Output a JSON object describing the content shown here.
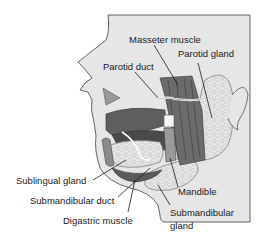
{
  "diagram": {
    "colors": {
      "skin": "#e6e6e6",
      "outline": "#555555",
      "muscle": "#6b6b6b",
      "muscle_dark": "#4a4a4a",
      "gland": "#d4d4d4",
      "gland_cell": "#f2f2f2",
      "tongue": "#5e5e5e",
      "teeth": "#f5f5f5",
      "text": "#1a1a1a"
    },
    "labels": {
      "masseter_muscle": "Masseter muscle",
      "parotid_gland": "Parotid gland",
      "parotid_duct": "Parotid duct",
      "sublingual_gland": "Sublingual gland",
      "submandibular_duct": "Submandibular duct",
      "digastric_muscle": "Digastric muscle",
      "mandible": "Mandible",
      "submandibular_gland_line1": "Submandibular",
      "submandibular_gland_line2": "gland"
    }
  }
}
